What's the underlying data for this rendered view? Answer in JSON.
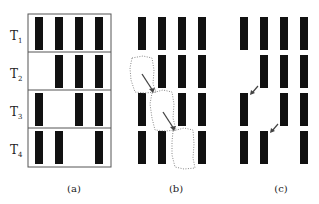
{
  "figure": {
    "panels": [
      {
        "id": "a",
        "label": "(a)",
        "x0": 35,
        "boxed": true
      },
      {
        "id": "b",
        "label": "(b)",
        "x0": 138,
        "boxed": false
      },
      {
        "id": "c",
        "label": "(c)",
        "x0": 240,
        "boxed": false
      }
    ],
    "row_labels": [
      {
        "main": "T",
        "sub": "1"
      },
      {
        "main": "T",
        "sub": "2"
      },
      {
        "main": "T",
        "sub": "3"
      },
      {
        "main": "T",
        "sub": "4"
      }
    ],
    "rows_present": [
      [
        1,
        1,
        1,
        1
      ],
      [
        0,
        1,
        1,
        1
      ],
      [
        1,
        0,
        1,
        1
      ],
      [
        1,
        1,
        0,
        1
      ]
    ],
    "colors": {
      "bar": "#111111",
      "border": "#555555",
      "arrow": "#444444",
      "dotted": "#888888"
    }
  }
}
